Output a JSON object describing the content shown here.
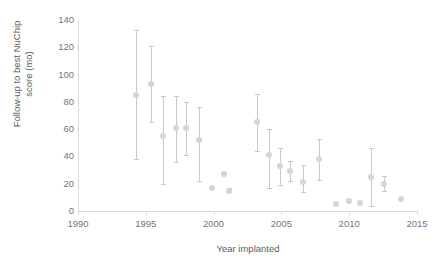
{
  "chart_data": {
    "type": "scatter",
    "title": "",
    "xlabel": "Year implanted",
    "ylabel": "Follow-up to best NuChip score (mo)",
    "xlim": [
      1990,
      2015
    ],
    "ylim": [
      0,
      140
    ],
    "xticks": [
      1990,
      1995,
      2000,
      2005,
      2010,
      2015
    ],
    "yticks": [
      0,
      20,
      40,
      60,
      80,
      100,
      120,
      140
    ],
    "grid": false,
    "legend": null,
    "error_bars": "vertical range bars with caps",
    "marker_color": "#d5d5d5",
    "errorbar_color": "#c9c9c9",
    "axis_color": "#d9d9d9",
    "points": [
      {
        "x": 1994.3,
        "y": 85,
        "low": 38,
        "high": 133
      },
      {
        "x": 1995.4,
        "y": 93,
        "low": 65,
        "high": 121
      },
      {
        "x": 1996.3,
        "y": 55,
        "low": 20,
        "high": 84
      },
      {
        "x": 1997.2,
        "y": 61,
        "low": 36,
        "high": 84
      },
      {
        "x": 1998.0,
        "y": 61,
        "low": 41,
        "high": 80
      },
      {
        "x": 1998.9,
        "y": 52,
        "low": 22,
        "high": 76
      },
      {
        "x": 1999.9,
        "y": 17,
        "low": 17,
        "high": 17
      },
      {
        "x": 2000.8,
        "y": 27,
        "low": 27,
        "high": 27
      },
      {
        "x": 2001.1,
        "y": 15,
        "low": 14,
        "high": 17
      },
      {
        "x": 2003.2,
        "y": 65,
        "low": 44,
        "high": 86
      },
      {
        "x": 2004.1,
        "y": 41,
        "low": 17,
        "high": 60
      },
      {
        "x": 2004.9,
        "y": 33,
        "low": 19,
        "high": 46
      },
      {
        "x": 2005.6,
        "y": 29,
        "low": 22,
        "high": 37
      },
      {
        "x": 2006.6,
        "y": 21,
        "low": 14,
        "high": 34
      },
      {
        "x": 2007.8,
        "y": 38,
        "low": 23,
        "high": 53
      },
      {
        "x": 2009.0,
        "y": 5,
        "low": 5,
        "high": 5
      },
      {
        "x": 2010.0,
        "y": 7,
        "low": 7,
        "high": 7
      },
      {
        "x": 2010.8,
        "y": 6,
        "low": 6,
        "high": 6
      },
      {
        "x": 2011.6,
        "y": 25,
        "low": 4,
        "high": 46
      },
      {
        "x": 2012.6,
        "y": 20,
        "low": 15,
        "high": 26
      },
      {
        "x": 2013.8,
        "y": 9,
        "low": 9,
        "high": 9
      }
    ]
  },
  "axes": {
    "y_tick_labels": [
      "140",
      "120",
      "100",
      "80",
      "60",
      "40",
      "20",
      "0"
    ],
    "x_tick_labels": [
      "1990",
      "1995",
      "2000",
      "2005",
      "2010",
      "2015"
    ],
    "y_title": "Follow-up to best NuChip score (mo)",
    "x_title": "Year implanted"
  }
}
